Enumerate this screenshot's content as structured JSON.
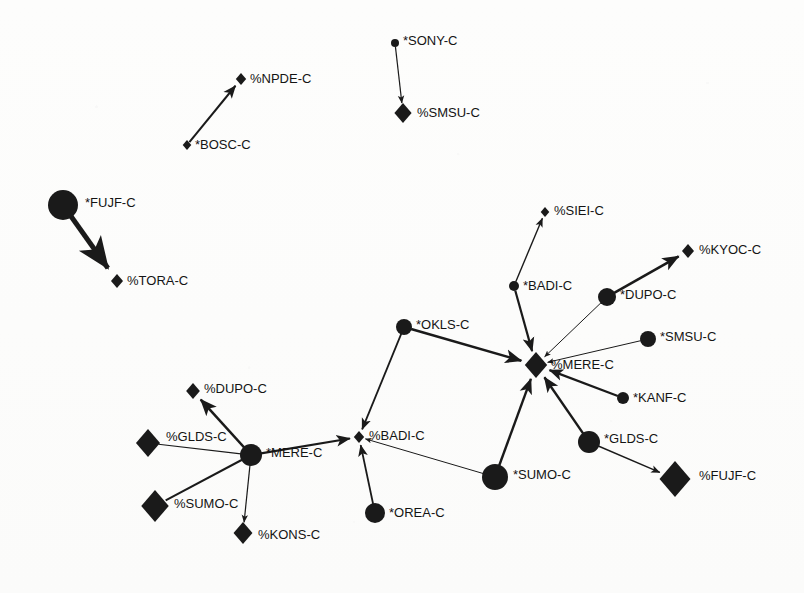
{
  "diagram": {
    "background_color": "#fdfdfc",
    "node_color": "#1a1a1a",
    "edge_color": "#1a1a1a",
    "label_color": "#141414",
    "width": 804,
    "height": 593
  },
  "chart_data": {
    "type": "diagram",
    "title": "",
    "nodes": [
      {
        "id": "n1",
        "label": "*FUJF-C",
        "shape": "circle",
        "x": 63,
        "y": 205,
        "size": 15
      },
      {
        "id": "n2",
        "label": "%TORA-C",
        "shape": "diamond",
        "x": 117,
        "y": 281,
        "size": 7
      },
      {
        "id": "n3",
        "label": "*BOSC-C",
        "shape": "diamond",
        "x": 187,
        "y": 145,
        "size": 5
      },
      {
        "id": "n4",
        "label": "%NPDE-C",
        "shape": "diamond",
        "x": 241,
        "y": 79,
        "size": 6
      },
      {
        "id": "n5",
        "label": "*SONY-C",
        "shape": "circle",
        "x": 395,
        "y": 43,
        "size": 4
      },
      {
        "id": "n6",
        "label": "%SMSU-C",
        "shape": "diamond",
        "x": 403,
        "y": 113,
        "size": 10
      },
      {
        "id": "n7",
        "label": "%SIEI-C",
        "shape": "diamond",
        "x": 545,
        "y": 212,
        "size": 5
      },
      {
        "id": "n8",
        "label": "*BADI-C",
        "shape": "circle",
        "x": 514,
        "y": 286,
        "size": 5
      },
      {
        "id": "n9",
        "label": "%KYOC-C",
        "shape": "diamond",
        "x": 688,
        "y": 251,
        "size": 7
      },
      {
        "id": "n10",
        "label": "*DUPO-C",
        "shape": "circle",
        "x": 607,
        "y": 297,
        "size": 9
      },
      {
        "id": "n11",
        "label": "*SMSU-C",
        "shape": "circle",
        "x": 648,
        "y": 339,
        "size": 8
      },
      {
        "id": "n12",
        "label": "%MERE-C",
        "shape": "diamond",
        "x": 536,
        "y": 365,
        "size": 13
      },
      {
        "id": "n13",
        "label": "*KANF-C",
        "shape": "circle",
        "x": 623,
        "y": 398,
        "size": 6
      },
      {
        "id": "n14",
        "label": "*OKLS-C",
        "shape": "circle",
        "x": 404,
        "y": 327,
        "size": 8
      },
      {
        "id": "n15",
        "label": "*GLDS-C",
        "shape": "circle",
        "x": 589,
        "y": 442,
        "size": 11
      },
      {
        "id": "n16",
        "label": "%FUJF-C",
        "shape": "diamond",
        "x": 675,
        "y": 479,
        "size": 18
      },
      {
        "id": "n17",
        "label": "*SUMO-C",
        "shape": "circle",
        "x": 495,
        "y": 477,
        "size": 13
      },
      {
        "id": "n18",
        "label": "%BADI-C",
        "shape": "diamond",
        "x": 359,
        "y": 437,
        "size": 6
      },
      {
        "id": "n19",
        "label": "*OREA-C",
        "shape": "circle",
        "x": 375,
        "y": 513,
        "size": 10
      },
      {
        "id": "n20",
        "label": "%DUPO-C",
        "shape": "diamond",
        "x": 193,
        "y": 391,
        "size": 8
      },
      {
        "id": "n21",
        "label": "%GLDS-C",
        "shape": "diamond",
        "x": 148,
        "y": 443,
        "size": 14
      },
      {
        "id": "n22",
        "label": "*MERE-C",
        "shape": "circle",
        "x": 251,
        "y": 455,
        "size": 11
      },
      {
        "id": "n23",
        "label": "%SUMO-C",
        "shape": "diamond",
        "x": 155,
        "y": 506,
        "size": 16
      },
      {
        "id": "n24",
        "label": "%KONS-C",
        "shape": "diamond",
        "x": 243,
        "y": 533,
        "size": 11
      }
    ],
    "edges": [
      {
        "source": "n1",
        "target": "n2",
        "weight": 5.0,
        "arrow": true
      },
      {
        "source": "n3",
        "target": "n4",
        "weight": 2.0,
        "arrow": true
      },
      {
        "source": "n5",
        "target": "n6",
        "weight": 1.2,
        "arrow": true
      },
      {
        "source": "n8",
        "target": "n7",
        "weight": 1.4,
        "arrow": true
      },
      {
        "source": "n10",
        "target": "n9",
        "weight": 2.6,
        "arrow": true
      },
      {
        "source": "n8",
        "target": "n12",
        "weight": 2.2,
        "arrow": true
      },
      {
        "source": "n10",
        "target": "n12",
        "weight": 1.0,
        "arrow": true
      },
      {
        "source": "n11",
        "target": "n12",
        "weight": 1.0,
        "arrow": true
      },
      {
        "source": "n13",
        "target": "n12",
        "weight": 2.2,
        "arrow": true
      },
      {
        "source": "n14",
        "target": "n12",
        "weight": 2.6,
        "arrow": true
      },
      {
        "source": "n15",
        "target": "n12",
        "weight": 2.4,
        "arrow": true
      },
      {
        "source": "n17",
        "target": "n12",
        "weight": 2.4,
        "arrow": true
      },
      {
        "source": "n15",
        "target": "n16",
        "weight": 1.4,
        "arrow": true
      },
      {
        "source": "n14",
        "target": "n18",
        "weight": 1.8,
        "arrow": true
      },
      {
        "source": "n17",
        "target": "n18",
        "weight": 1.0,
        "arrow": true
      },
      {
        "source": "n19",
        "target": "n18",
        "weight": 1.8,
        "arrow": true
      },
      {
        "source": "n22",
        "target": "n18",
        "weight": 2.2,
        "arrow": true
      },
      {
        "source": "n22",
        "target": "n20",
        "weight": 2.6,
        "arrow": true
      },
      {
        "source": "n21",
        "target": "n22",
        "weight": 1.2,
        "arrow": false
      },
      {
        "source": "n23",
        "target": "n22",
        "weight": 2.0,
        "arrow": false
      },
      {
        "source": "n22",
        "target": "n24",
        "weight": 1.2,
        "arrow": true
      }
    ],
    "label_offsets": {
      "n1": {
        "dx": 22,
        "dy": -1
      },
      "n2": {
        "dx": 10,
        "dy": 1
      },
      "n3": {
        "dx": 8,
        "dy": 1
      },
      "n4": {
        "dx": 9,
        "dy": 1
      },
      "n5": {
        "dx": 8,
        "dy": -1
      },
      "n6": {
        "dx": 14,
        "dy": 1
      },
      "n7": {
        "dx": 9,
        "dy": 0
      },
      "n8": {
        "dx": 9,
        "dy": 1
      },
      "n9": {
        "dx": 11,
        "dy": 0
      },
      "n10": {
        "dx": 13,
        "dy": -1
      },
      "n11": {
        "dx": 12,
        "dy": -1
      },
      "n12": {
        "dx": 15,
        "dy": 1
      },
      "n13": {
        "dx": 10,
        "dy": 1
      },
      "n14": {
        "dx": 12,
        "dy": -1
      },
      "n15": {
        "dx": 15,
        "dy": -2
      },
      "n16": {
        "dx": 24,
        "dy": -2
      },
      "n17": {
        "dx": 18,
        "dy": -1
      },
      "n18": {
        "dx": 10,
        "dy": 0
      },
      "n19": {
        "dx": 14,
        "dy": 1
      },
      "n20": {
        "dx": 11,
        "dy": -1
      },
      "n21": {
        "dx": 18,
        "dy": -5
      },
      "n22": {
        "dx": 15,
        "dy": -1
      },
      "n23": {
        "dx": 19,
        "dy": -1
      },
      "n24": {
        "dx": 15,
        "dy": 3
      }
    }
  }
}
